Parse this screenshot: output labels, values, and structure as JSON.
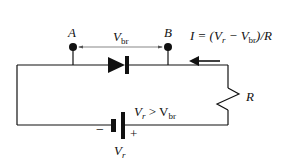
{
  "diagram": {
    "type": "circuit",
    "labels": {
      "node_a": "A",
      "node_b": "B",
      "vbr_main": "V",
      "vbr_sub": "br",
      "current_eq_i": "I = (V",
      "current_eq_r_sub": "r",
      "current_eq_minus": " − V",
      "current_eq_br_sub": "br",
      "current_eq_tail": ")/R",
      "resistor": "R",
      "battery_cond_v": "V",
      "battery_cond_r_sub": "r",
      "battery_cond_gt": " > V",
      "battery_cond_br_sub": "br",
      "battery_minus": "−",
      "battery_plus": "+",
      "battery_v": "V",
      "battery_r_sub": "r"
    },
    "colors": {
      "stroke": "#111111",
      "background": "#ffffff",
      "arrow_line": "#555555"
    }
  }
}
